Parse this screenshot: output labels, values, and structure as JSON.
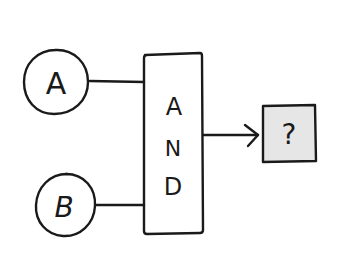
{
  "diagram": {
    "type": "logic-gate",
    "inputs": [
      {
        "id": "A",
        "label": "A"
      },
      {
        "id": "B",
        "label": "B"
      }
    ],
    "gate": {
      "label_letters": [
        "A",
        "N",
        "D"
      ],
      "label": "AND"
    },
    "output": {
      "label": "?",
      "fill_color": "#e6e6e6"
    },
    "colors": {
      "stroke": "#1a1a1a",
      "background": "#ffffff"
    }
  }
}
